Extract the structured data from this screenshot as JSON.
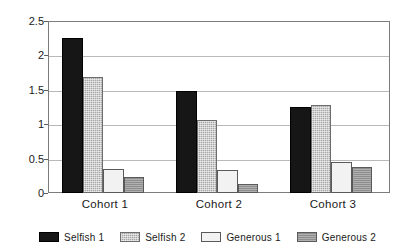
{
  "chart_data": {
    "type": "bar",
    "title": "",
    "subtitle": "",
    "xlabel": "",
    "ylabel": "",
    "categories": [
      "Cohort 1",
      "Cohort 2",
      "Cohort 3"
    ],
    "series": [
      {
        "name": "Selfish 1",
        "color": "#161616",
        "values": [
          2.25,
          1.48,
          1.25
        ]
      },
      {
        "name": "Selfish 2",
        "color": "#a6a6a6",
        "values": [
          1.69,
          1.06,
          1.28
        ]
      },
      {
        "name": "Generous 1",
        "color": "#f2f2f2",
        "values": [
          0.35,
          0.33,
          0.45
        ]
      },
      {
        "name": "Generous 2",
        "color": "#8e8e8e",
        "values": [
          0.24,
          0.13,
          0.38
        ]
      }
    ],
    "ylim": [
      0,
      2.5
    ],
    "yticks": [
      0,
      0.5,
      1,
      1.5,
      2,
      2.5
    ],
    "ytick_labels": [
      "0",
      "0.5",
      "1",
      "1.5",
      "2",
      "2.5"
    ],
    "grid": true,
    "grid_axis": "y",
    "legend_position": "bottom",
    "legend_entries": [
      "Selfish 1",
      "Selfish 2",
      "Generous 1",
      "Generous 2"
    ]
  }
}
